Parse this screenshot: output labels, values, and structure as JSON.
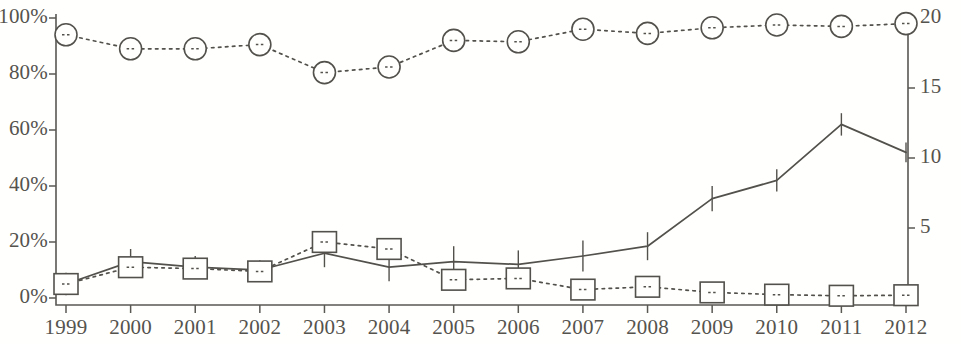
{
  "chart_data": {
    "type": "line",
    "title": "",
    "subtitle": "",
    "xlabel": "",
    "ylabel": "",
    "grid": false,
    "legend_position": "none",
    "x": [
      1999,
      2000,
      2001,
      2002,
      2003,
      2004,
      2005,
      2006,
      2007,
      2008,
      2009,
      2010,
      2011,
      2012
    ],
    "categories": [
      "1999",
      "2000",
      "2001",
      "2002",
      "2003",
      "2004",
      "2005",
      "2006",
      "2007",
      "2008",
      "2009",
      "2010",
      "2011",
      "2012"
    ],
    "axes": {
      "x": {
        "tick_labels": [
          "1999",
          "2000",
          "2001",
          "2002",
          "2003",
          "2004",
          "2005",
          "2006",
          "2007",
          "2008",
          "2009",
          "2010",
          "2011",
          "2012"
        ],
        "min": 1999,
        "max": 2012
      },
      "y_left": {
        "label": "",
        "tick_labels": [
          "0%",
          "20%",
          "40%",
          "60%",
          "80%",
          "100%"
        ],
        "tick_values": [
          0,
          20,
          40,
          60,
          80,
          100
        ],
        "min": 0,
        "max": 100,
        "unit": "%",
        "note_top_label_clipped": "100%"
      },
      "y_right": {
        "label": "",
        "tick_labels": [
          "0",
          "5",
          "10",
          "15",
          "20"
        ],
        "tick_values": [
          0,
          5,
          10,
          15,
          20
        ],
        "min": 0,
        "max": 20,
        "unit": ""
      }
    },
    "series": [
      {
        "name": "solid-line-with-error-bars",
        "marker": "none",
        "linestyle": "solid",
        "axis": "y_left",
        "color": "#53514c",
        "values": [
          5,
          13,
          11,
          10,
          16,
          11,
          13,
          12,
          15,
          18.5,
          35.5,
          42,
          62,
          52
        ],
        "error_bars": [
          4,
          4.5,
          4,
          3.5,
          5,
          5,
          5.5,
          5,
          5.5,
          5,
          4.5,
          4,
          4,
          3.5
        ]
      },
      {
        "name": "dotted-line-square-markers",
        "marker": "square",
        "linestyle": "dotted",
        "axis": "y_left",
        "color": "#53514c",
        "values": [
          5,
          11,
          10.5,
          9.5,
          20,
          17.5,
          6.5,
          7,
          3,
          4,
          2,
          1.2,
          0.8,
          1
        ]
      },
      {
        "name": "dotted-line-circle-markers",
        "marker": "circle",
        "linestyle": "dotted",
        "axis": "y_right",
        "color": "#53514c",
        "values": [
          18.8,
          17.8,
          17.8,
          18.1,
          16.1,
          16.5,
          18.4,
          18.3,
          19.2,
          18.9,
          19.3,
          19.5,
          19.4,
          19.6
        ]
      }
    ]
  },
  "style": {
    "background": "#fffffd",
    "axis_color": "#5a5853",
    "text_color": "#55534e"
  }
}
